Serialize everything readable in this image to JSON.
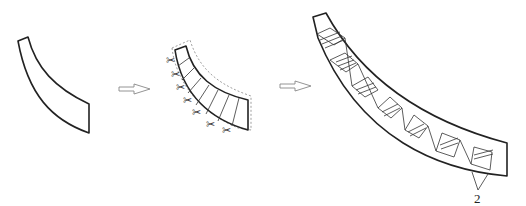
{
  "figure": {
    "stages": [
      {
        "id": "stage-1",
        "name": "curved-strip"
      },
      {
        "id": "stage-2",
        "name": "strip-cut-into-segments",
        "scissors_count": 7,
        "segment_lines": 7
      },
      {
        "id": "stage-3",
        "name": "assembled-arc-with-folded-segments",
        "segments": 8
      }
    ],
    "arrows": [
      {
        "id": "arrow-1"
      },
      {
        "id": "arrow-2"
      }
    ],
    "annotations": [
      {
        "id": "callout-2",
        "text": "2"
      }
    ],
    "colors": {
      "line": "#222222",
      "arrow": "#888888",
      "dashed": "#777777"
    }
  }
}
